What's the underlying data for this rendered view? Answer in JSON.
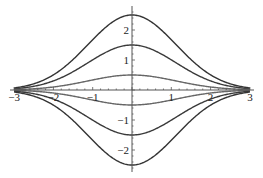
{
  "chart_data": {
    "type": "line",
    "title": "",
    "xlabel": "",
    "ylabel": "",
    "xlim": [
      -3,
      3
    ],
    "ylim": [
      -2.75,
      2.75
    ],
    "grid": false,
    "legend": null,
    "x_ticks": [
      -3,
      -2,
      -1,
      1,
      2,
      3
    ],
    "x_tick_labels": [
      "−3",
      "−2",
      "−1",
      "1",
      "2",
      "3"
    ],
    "y_ticks": [
      -2,
      -1,
      1,
      2
    ],
    "y_tick_labels": [
      "−2",
      "−1",
      "1",
      "2"
    ],
    "function_form": "A * exp(-x^2 / 2.5)",
    "series": [
      {
        "name": "curve-a-2.5",
        "amplitude": 2.5,
        "x": [
          -3,
          -2,
          -1,
          0,
          1,
          2,
          3
        ],
        "values": [
          0.68,
          0.5,
          1.68,
          2.5,
          1.68,
          0.5,
          0.07
        ]
      },
      {
        "name": "curve-a-1.5",
        "amplitude": 1.5,
        "x": [
          -3,
          -2,
          -1,
          0,
          1,
          2,
          3
        ],
        "values": [
          0.04,
          0.3,
          1.01,
          1.5,
          1.01,
          0.3,
          0.04
        ]
      },
      {
        "name": "curve-a-0.5",
        "amplitude": 0.5,
        "x": [
          -3,
          -2,
          -1,
          0,
          1,
          2,
          3
        ],
        "values": [
          0.01,
          0.1,
          0.34,
          0.5,
          0.34,
          0.1,
          0.01
        ]
      },
      {
        "name": "curve-a-neg-0.5",
        "amplitude": -0.5,
        "x": [
          -3,
          -2,
          -1,
          0,
          1,
          2,
          3
        ],
        "values": [
          -0.01,
          -0.1,
          -0.34,
          -0.5,
          -0.34,
          -0.1,
          -0.01
        ]
      },
      {
        "name": "curve-a-neg-1.5",
        "amplitude": -1.5,
        "x": [
          -3,
          -2,
          -1,
          0,
          1,
          2,
          3
        ],
        "values": [
          -0.04,
          -0.3,
          -1.01,
          -1.5,
          -1.01,
          -0.3,
          -0.04
        ]
      },
      {
        "name": "curve-a-neg-2.5",
        "amplitude": -2.5,
        "x": [
          -3,
          -2,
          -1,
          0,
          1,
          2,
          3
        ],
        "values": [
          -0.07,
          -0.5,
          -1.68,
          -2.5,
          -1.68,
          -0.5,
          -0.07
        ]
      }
    ],
    "colors": {
      "outer": "#333333",
      "middle": "#3a3a3a",
      "inner": "#666666",
      "axis": "#555555",
      "text": "#222222"
    }
  }
}
